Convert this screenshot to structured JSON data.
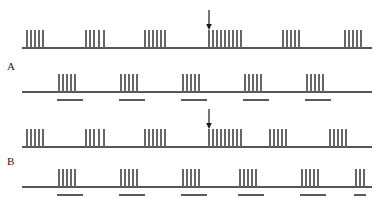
{
  "figure": {
    "background_color": "#ffffff",
    "width": 379,
    "height": 198,
    "spike_color": "#666666",
    "baseline_color": "#555555",
    "stimulus_bar_color": "#5a5a5a",
    "arrow_color": "#1a1a1a",
    "label_color": "#1a1a1a"
  },
  "panels": [
    {
      "id": "A",
      "label": "A",
      "label_x": 7,
      "label_y": 61,
      "traces": [
        {
          "id": "A-top",
          "name": "neuron-trace-a-upper",
          "baseline_y": 48,
          "baseline_x0": 22,
          "baseline_x1": 372,
          "spike_height": 18,
          "arrow": {
            "x": 209,
            "y_top": 10,
            "y_bottom": 30
          },
          "stimulus_bars": [],
          "bursts": [
            {
              "spikes": [
                27,
                31,
                35,
                39,
                43
              ]
            },
            {
              "spikes": [
                86,
                90,
                94,
                99,
                104
              ]
            },
            {
              "spikes": [
                145,
                149,
                153,
                157,
                161,
                165
              ]
            },
            {
              "spikes": [
                209,
                213,
                217,
                221,
                225,
                229,
                233,
                237,
                241
              ]
            },
            {
              "spikes": [
                283,
                287,
                291,
                295,
                299
              ]
            },
            {
              "spikes": [
                345,
                349,
                353,
                357,
                361
              ]
            }
          ]
        },
        {
          "id": "A-bottom",
          "name": "neuron-trace-a-lower",
          "baseline_y": 92,
          "baseline_x0": 22,
          "baseline_x1": 372,
          "spike_height": 18,
          "arrow": null,
          "stimulus_bars": [
            {
              "x0": 57,
              "x1": 83
            },
            {
              "x0": 119,
              "x1": 145
            },
            {
              "x0": 181,
              "x1": 207
            },
            {
              "x0": 243,
              "x1": 269
            },
            {
              "x0": 305,
              "x1": 331
            }
          ],
          "bursts": [
            {
              "spikes": [
                59,
                63,
                67,
                71,
                75
              ]
            },
            {
              "spikes": [
                121,
                125,
                129,
                133,
                137
              ]
            },
            {
              "spikes": [
                183,
                187,
                191,
                195,
                199
              ]
            },
            {
              "spikes": [
                245,
                249,
                253,
                257,
                261
              ]
            },
            {
              "spikes": [
                307,
                311,
                315,
                319,
                323
              ]
            }
          ]
        }
      ]
    },
    {
      "id": "B",
      "label": "B",
      "label_x": 7,
      "label_y": 156,
      "traces": [
        {
          "id": "B-top",
          "name": "neuron-trace-b-upper",
          "baseline_y": 147,
          "baseline_x0": 22,
          "baseline_x1": 372,
          "spike_height": 18,
          "arrow": {
            "x": 209,
            "y_top": 109,
            "y_bottom": 129
          },
          "stimulus_bars": [],
          "bursts": [
            {
              "spikes": [
                27,
                31,
                35,
                39,
                43
              ]
            },
            {
              "spikes": [
                86,
                90,
                94,
                99,
                104
              ]
            },
            {
              "spikes": [
                145,
                149,
                153,
                157,
                161,
                165
              ]
            },
            {
              "spikes": [
                209,
                213,
                217,
                221,
                225,
                229,
                233,
                237,
                241
              ]
            },
            {
              "spikes": [
                270,
                274,
                278,
                282,
                286
              ]
            },
            {
              "spikes": [
                330,
                334,
                338,
                342,
                346
              ]
            }
          ]
        },
        {
          "id": "B-bottom",
          "name": "neuron-trace-b-lower",
          "baseline_y": 187,
          "baseline_x0": 22,
          "baseline_x1": 372,
          "spike_height": 18,
          "arrow": null,
          "stimulus_bars": [
            {
              "x0": 57,
              "x1": 83
            },
            {
              "x0": 119,
              "x1": 145
            },
            {
              "x0": 181,
              "x1": 207
            },
            {
              "x0": 238,
              "x1": 264
            },
            {
              "x0": 300,
              "x1": 326
            },
            {
              "x0": 354,
              "x1": 366
            }
          ],
          "bursts": [
            {
              "spikes": [
                59,
                63,
                67,
                71,
                75
              ]
            },
            {
              "spikes": [
                121,
                125,
                129,
                133,
                137
              ]
            },
            {
              "spikes": [
                183,
                187,
                191,
                195,
                199
              ]
            },
            {
              "spikes": [
                240,
                244,
                248,
                252,
                256
              ]
            },
            {
              "spikes": [
                302,
                306,
                310,
                314,
                318
              ]
            },
            {
              "spikes": [
                356,
                360,
                364
              ]
            }
          ]
        }
      ]
    }
  ]
}
